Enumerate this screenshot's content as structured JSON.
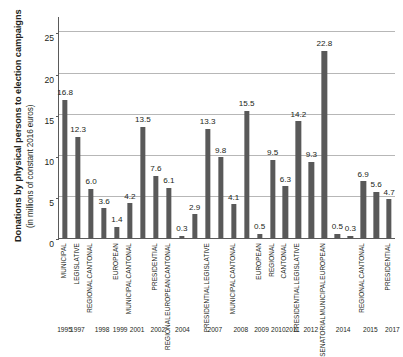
{
  "chart_data": {
    "type": "bar",
    "title": "",
    "ylabel": "Donations by physical persons to election campaigns",
    "ylabel_sub": "(in millions of constant 2016 euros)",
    "xlabel": "",
    "ylim": [
      0,
      27
    ],
    "yticks": [
      0,
      5,
      10,
      15,
      20,
      25
    ],
    "grid": true,
    "legend": "none",
    "bar_color": "#595959",
    "categories": [
      "MUNICIPAL",
      "LEGISLATIVE",
      "CANTONAL REGIONAL",
      "EUROPEAN",
      "CANTONAL MUNICIPAL",
      "PRESIDENTIAL",
      "CANTONAL EUROPEAN REGIONAL",
      "LEGISLATIVE PRESIDENTIAL",
      "CANTONAL MUNICIPAL",
      "EUROPEAN",
      "REGIONAL",
      "CANTONAL",
      "LEGISLATIVE PRESIDENTIAL",
      "EUROPEAN MUNICIPAL SENATORIAL",
      "CANTONAL REGIONAL",
      "PRESIDENTIAL"
    ],
    "bars": [
      {
        "value": 16.8,
        "label": "16.8",
        "cat_lines": [
          "MUNICIPAL"
        ],
        "slot": 0
      },
      {
        "value": 12.3,
        "label": "12.3",
        "cat_lines": [
          "LEGISLATIVE"
        ],
        "slot": 1
      },
      {
        "value": 6.0,
        "label": "6.0",
        "cat_lines": [
          "CANTONAL",
          "REGIONAL"
        ],
        "slot": 2
      },
      {
        "value": 3.6,
        "label": "3.6",
        "cat_lines": [],
        "slot": 3
      },
      {
        "value": 1.4,
        "label": "1.4",
        "cat_lines": [
          "EUROPEAN"
        ],
        "slot": 4
      },
      {
        "value": 4.2,
        "label": "4.2",
        "cat_lines": [
          "CANTONAL",
          "MUNICIPAL"
        ],
        "slot": 5
      },
      {
        "value": 13.5,
        "label": "13.5",
        "cat_lines": [],
        "slot": 6
      },
      {
        "value": 7.6,
        "label": "7.6",
        "cat_lines": [
          "PRESIDENTIAL"
        ],
        "slot": 7
      },
      {
        "value": 6.1,
        "label": "6.1",
        "cat_lines": [
          "CANTONAL",
          "EUROPEAN",
          "REGIONAL"
        ],
        "slot": 8
      },
      {
        "value": 0.3,
        "label": "0.3",
        "cat_lines": [],
        "slot": 9
      },
      {
        "value": 2.9,
        "label": "2.9",
        "cat_lines": [],
        "slot": 10
      },
      {
        "value": 13.3,
        "label": "13.3",
        "cat_lines": [
          "LEGISLATIVE",
          "PRESIDENTIAL"
        ],
        "slot": 11
      },
      {
        "value": 9.8,
        "label": "9.8",
        "cat_lines": [],
        "slot": 12
      },
      {
        "value": 4.1,
        "label": "4.1",
        "cat_lines": [
          "CANTONAL",
          "MUNICIPAL"
        ],
        "slot": 13
      },
      {
        "value": 15.5,
        "label": "15.5",
        "cat_lines": [],
        "slot": 14
      },
      {
        "value": 0.5,
        "label": "0.5",
        "cat_lines": [
          "EUROPEAN"
        ],
        "slot": 15
      },
      {
        "value": 9.5,
        "label": "9.5",
        "cat_lines": [
          "REGIONAL"
        ],
        "slot": 16
      },
      {
        "value": 6.3,
        "label": "6.3",
        "cat_lines": [
          "CANTONAL"
        ],
        "slot": 17
      },
      {
        "value": 14.2,
        "label": "14.2",
        "cat_lines": [
          "LEGISLATIVE",
          "PRESIDENTIAL"
        ],
        "slot": 18
      },
      {
        "value": 9.3,
        "label": "9.3",
        "cat_lines": [],
        "slot": 19
      },
      {
        "value": 22.8,
        "label": "22.8",
        "cat_lines": [
          "EUROPEAN",
          "MUNICIPAL",
          "SENATORIAL"
        ],
        "slot": 20
      },
      {
        "value": 0.5,
        "label": "0.5",
        "cat_lines": [],
        "slot": 21
      },
      {
        "value": 0.3,
        "label": "0.3",
        "cat_lines": [],
        "slot": 22
      },
      {
        "value": 6.9,
        "label": "6.9",
        "cat_lines": [
          "CANTONAL",
          "REGIONAL"
        ],
        "slot": 23
      },
      {
        "value": 5.6,
        "label": "5.6",
        "cat_lines": [],
        "slot": 24
      },
      {
        "value": 4.7,
        "label": "4.7",
        "cat_lines": [
          "PRESIDENTIAL"
        ],
        "slot": 25
      }
    ],
    "years": [
      {
        "label": "1995",
        "slot": 0
      },
      {
        "label": "1997",
        "slot": 1
      },
      {
        "label": "1998",
        "slot": 2.9
      },
      {
        "label": "1999",
        "slot": 4.3
      },
      {
        "label": "2001",
        "slot": 5.6
      },
      {
        "label": "2002",
        "slot": 7.2
      },
      {
        "label": "2004",
        "slot": 9.1
      },
      {
        "label": "2007",
        "slot": 11.6
      },
      {
        "label": "2008",
        "slot": 13.6
      },
      {
        "label": "2009",
        "slot": 15.2
      },
      {
        "label": "2010",
        "slot": 16.5
      },
      {
        "label": "2011",
        "slot": 17.6
      },
      {
        "label": "2012",
        "slot": 19.0
      },
      {
        "label": "2014",
        "slot": 21.5
      },
      {
        "label": "2015",
        "slot": 23.6
      },
      {
        "label": "2017",
        "slot": 25.3
      }
    ]
  }
}
